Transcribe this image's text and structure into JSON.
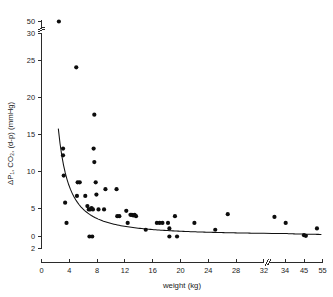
{
  "chart_data": {
    "type": "scatter",
    "title": "",
    "xlabel": "weight (kg)",
    "ylabel": "ΔP₁, CO₂, (d-p) (mmHg)",
    "xlim": [
      0,
      55
    ],
    "ylim": [
      -2,
      50
    ],
    "grid": false,
    "legend": null,
    "x_ticks": [
      0,
      4,
      8,
      12,
      16,
      20,
      24,
      28,
      32,
      34,
      45,
      55
    ],
    "x_tick_labels": [
      "0",
      "4",
      "8",
      "12",
      "16",
      "20",
      "24",
      "28",
      "32",
      "34",
      "45",
      "55"
    ],
    "y_ticks": [
      -2,
      0,
      5,
      10,
      15,
      20,
      25,
      30,
      50
    ],
    "y_tick_labels": [
      "2",
      "0",
      "5",
      "10",
      "15",
      "20",
      "25",
      "30",
      "50"
    ],
    "x_axis_break_after": 32,
    "y_axis_break_between": [
      30,
      50
    ],
    "marker": "filled-circle",
    "marker_color": "#0d0d0d",
    "curve_color": "#111111",
    "curve_description": "decaying hyperbolic fit through the scatter",
    "points": [
      {
        "x": 2.5,
        "y": 50.0
      },
      {
        "x": 3.1,
        "y": 13.0
      },
      {
        "x": 3.1,
        "y": 12.0
      },
      {
        "x": 3.2,
        "y": 9.0
      },
      {
        "x": 3.4,
        "y": 5.0
      },
      {
        "x": 3.6,
        "y": 2.0
      },
      {
        "x": 5.0,
        "y": 25.0
      },
      {
        "x": 5.2,
        "y": 8.0
      },
      {
        "x": 5.5,
        "y": 8.0
      },
      {
        "x": 5.1,
        "y": 6.0
      },
      {
        "x": 6.3,
        "y": 6.0
      },
      {
        "x": 6.6,
        "y": 4.5
      },
      {
        "x": 6.8,
        "y": 4.0
      },
      {
        "x": 7.0,
        "y": 4.0
      },
      {
        "x": 7.2,
        "y": 4.2
      },
      {
        "x": 7.4,
        "y": 4.0
      },
      {
        "x": 6.9,
        "y": 0.0
      },
      {
        "x": 7.3,
        "y": 0.0
      },
      {
        "x": 7.6,
        "y": 18.0
      },
      {
        "x": 7.5,
        "y": 13.0
      },
      {
        "x": 7.6,
        "y": 11.0
      },
      {
        "x": 7.8,
        "y": 8.0
      },
      {
        "x": 7.9,
        "y": 6.2
      },
      {
        "x": 8.2,
        "y": 4.0
      },
      {
        "x": 9.2,
        "y": 7.0
      },
      {
        "x": 9.0,
        "y": 4.0
      },
      {
        "x": 10.8,
        "y": 7.0
      },
      {
        "x": 10.9,
        "y": 3.0
      },
      {
        "x": 11.2,
        "y": 3.0
      },
      {
        "x": 12.2,
        "y": 3.8
      },
      {
        "x": 12.4,
        "y": 2.0
      },
      {
        "x": 12.8,
        "y": 3.2
      },
      {
        "x": 13.0,
        "y": 3.2
      },
      {
        "x": 13.2,
        "y": 3.1
      },
      {
        "x": 13.4,
        "y": 3.2
      },
      {
        "x": 13.6,
        "y": 3.0
      },
      {
        "x": 15.0,
        "y": 1.0
      },
      {
        "x": 16.6,
        "y": 2.0
      },
      {
        "x": 17.0,
        "y": 2.0
      },
      {
        "x": 17.4,
        "y": 2.0
      },
      {
        "x": 18.2,
        "y": 2.0
      },
      {
        "x": 18.4,
        "y": 1.2
      },
      {
        "x": 18.4,
        "y": 0.0
      },
      {
        "x": 19.2,
        "y": 3.0
      },
      {
        "x": 19.5,
        "y": 0.0
      },
      {
        "x": 22.0,
        "y": 2.0
      },
      {
        "x": 25.0,
        "y": 1.0
      },
      {
        "x": 26.8,
        "y": 3.3
      },
      {
        "x": 33.0,
        "y": 2.9
      },
      {
        "x": 34.4,
        "y": 2.0
      },
      {
        "x": 45.0,
        "y": 0.2
      },
      {
        "x": 46.0,
        "y": 0.1
      },
      {
        "x": 52.0,
        "y": 1.2
      }
    ]
  }
}
